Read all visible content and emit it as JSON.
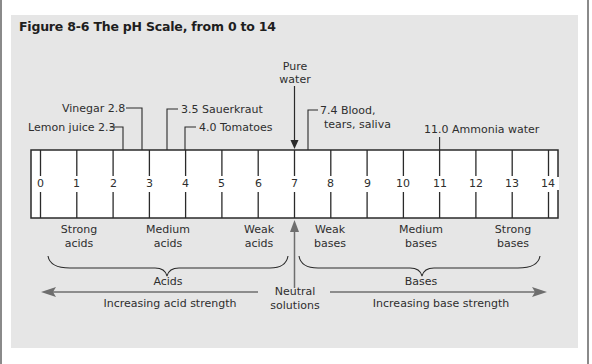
{
  "figure": {
    "title": "Figure 8-6 The pH Scale, from 0 to 14"
  },
  "scale": {
    "ticks": [
      "0",
      "1",
      "2",
      "3",
      "4",
      "5",
      "6",
      "7",
      "8",
      "9",
      "10",
      "11",
      "12",
      "13",
      "14"
    ]
  },
  "callouts": {
    "lemon": "Lemon juice 2.3",
    "vinegar": "Vinegar 2.8",
    "sauerkraut": "3.5 Sauerkraut",
    "tomatoes": "4.0 Tomatoes",
    "pure_water_line1": "Pure",
    "pure_water_line2": "water",
    "blood_line1": "7.4 Blood,",
    "blood_line2": "tears, saliva",
    "ammonia": "11.0 Ammonia water"
  },
  "categories": {
    "strong_acids_1": "Strong",
    "strong_acids_2": "acids",
    "medium_acids_1": "Medium",
    "medium_acids_2": "acids",
    "weak_acids_1": "Weak",
    "weak_acids_2": "acids",
    "weak_bases_1": "Weak",
    "weak_bases_2": "bases",
    "medium_bases_1": "Medium",
    "medium_bases_2": "bases",
    "strong_bases_1": "Strong",
    "strong_bases_2": "bases"
  },
  "groups": {
    "acids": "Acids",
    "bases": "Bases",
    "neutral_1": "Neutral",
    "neutral_2": "solutions"
  },
  "arrows": {
    "acid": "Increasing acid strength",
    "base": "Increasing base strength"
  },
  "colors": {
    "panel": "#e6e6e6",
    "scale_fill": "#ffffff",
    "line": "#2a2a2a",
    "arrow_gray": "#6e6e6e"
  }
}
